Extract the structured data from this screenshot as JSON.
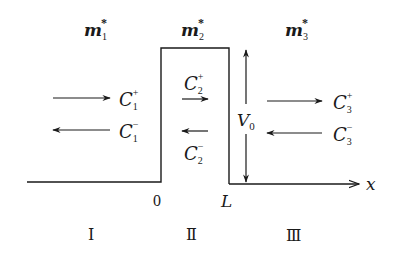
{
  "masses": {
    "m1": {
      "base": "m",
      "sub": "1",
      "sup": "*"
    },
    "m2": {
      "base": "m",
      "sub": "2",
      "sup": "*"
    },
    "m3": {
      "base": "m",
      "sub": "3",
      "sup": "*"
    }
  },
  "coefficients": {
    "c1p": {
      "base": "C",
      "sub": "1",
      "sup": "+"
    },
    "c1m": {
      "base": "C",
      "sub": "1",
      "sup": "−"
    },
    "c2p": {
      "base": "C",
      "sub": "2",
      "sup": "+"
    },
    "c2m": {
      "base": "C",
      "sub": "2",
      "sup": "−"
    },
    "c3p": {
      "base": "C",
      "sub": "3",
      "sup": "+"
    },
    "c3m": {
      "base": "C",
      "sub": "3",
      "sup": "−"
    }
  },
  "barrier": {
    "height_label": {
      "base": "V",
      "sub": "0"
    }
  },
  "axis": {
    "label": "x",
    "origin_label": "0",
    "width_label": "L"
  },
  "regions": [
    "Ⅰ",
    "Ⅱ",
    "Ⅲ"
  ]
}
